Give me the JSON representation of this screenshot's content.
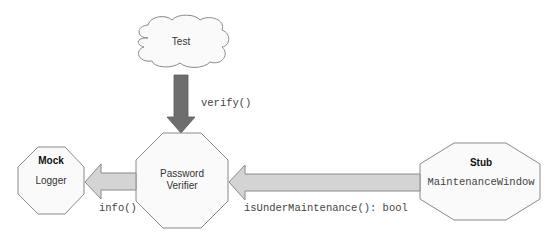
{
  "diagram": {
    "nodes": {
      "test": {
        "label": "Test",
        "shape": "cloud"
      },
      "password_verifier": {
        "line1": "Password",
        "line2": "Verifier",
        "shape": "octagon"
      },
      "mock": {
        "role": "Mock",
        "name": "Logger",
        "shape": "octagon"
      },
      "stub": {
        "role": "Stub",
        "name": "MaintenanceWindow",
        "shape": "octagon"
      }
    },
    "edges": {
      "verify": {
        "from": "Test",
        "to": "Password Verifier",
        "label": "verify()"
      },
      "info": {
        "from": "Password Verifier",
        "to": "Mock Logger",
        "label": "info()"
      },
      "maintenance": {
        "from": "Stub MaintenanceWindow",
        "to": "Password Verifier",
        "label": "isUnderMaintenance(): bool"
      }
    },
    "colors": {
      "outline": "#8a8a8a",
      "node_fill": "#fafafa",
      "dark_arrow": "#6e6e6e",
      "light_arrow": "#d4d4d4"
    }
  }
}
